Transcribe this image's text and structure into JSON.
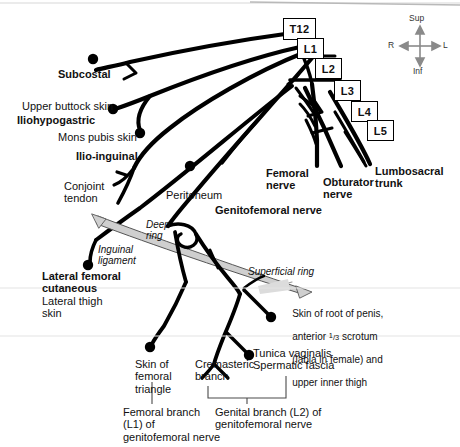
{
  "figure": {
    "ink_color": "#000000",
    "ligament_fill": "#c9c9c9",
    "compass_color": "#8a8a8a"
  },
  "vertebral_levels": [
    {
      "id": "t12",
      "label": "T12"
    },
    {
      "id": "l1",
      "label": "L1"
    },
    {
      "id": "l2",
      "label": "L2"
    },
    {
      "id": "l3",
      "label": "L3"
    },
    {
      "id": "l4",
      "label": "L4"
    },
    {
      "id": "l5",
      "label": "L5"
    }
  ],
  "compass": {
    "superior": "Sup",
    "inferior": "Inf",
    "right": "R",
    "left": "L"
  },
  "nerve_labels": {
    "subcostal": "Subcostal",
    "iliohypogastric": "Iliohypogastric",
    "ilioinguinal": "Ilio-inguinal",
    "genitofemoral": "Genitofemoral nerve",
    "femoral": "Femoral\nnerve",
    "obturator": "Obturator\nnerve",
    "lumbosacral": "Lumbosacral\ntrunk",
    "lateral_femoral_cutaneous": "Lateral femoral\ncutaneous"
  },
  "territory_labels": {
    "upper_buttock_skin": "Upper buttock skin",
    "mons_pubis_skin": "Mons pubis skin",
    "conjoint_tendon": "Conjoint\ntendon",
    "peritoneum": "Peritoneum",
    "lateral_thigh_skin": "Lateral thigh\nskin",
    "skin_femoral_triangle": "Skin of\nfemoral\ntriangle",
    "cremasteric_branch": "Cremasteric\nbranch",
    "tunica_vaginalis": "Tunica vaginalis\nSpermatic fascia"
  },
  "skin_root_penis": {
    "line1": "Skin of root of penis,",
    "line2_pre": "anterior ",
    "line2_frac_num": "1",
    "line2_frac_den": "3",
    "line2_post": " scrotum",
    "line3": "(labia in female) and",
    "line4": "upper inner thigh"
  },
  "anatomy_italic": {
    "inguinal_ligament": "Inguinal\nligament",
    "deep_ring": "Deep\nring",
    "superficial_ring": "Superficial ring"
  },
  "branch_captions": {
    "femoral_branch": "Femoral branch\n(L1) of\ngenitofemoral nerve",
    "genital_branch": "Genital branch (L2) of\ngenitofemoral nerve"
  }
}
